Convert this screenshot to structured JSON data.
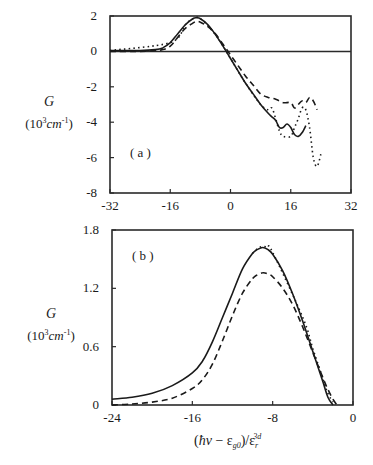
{
  "figure": {
    "x_axis_label": "(ħν − ε_g0)/ε_r^3d",
    "x_axis_label_parts": {
      "open": "(",
      "hnu": "ħν",
      "minus": " − ε",
      "sub": "g0",
      "close": ")/ε",
      "sub2": "r",
      "sup2": "3d"
    },
    "y_axis_label": {
      "symbol": "G",
      "unit_prefix": "(10",
      "unit_exp": "3",
      "unit_body": "cm",
      "unit_body_exp": "-1",
      "unit_close": ")"
    }
  },
  "chart_data": [
    {
      "type": "line",
      "panel_label": "( a )",
      "title": "",
      "xlabel": "",
      "ylabel": "G (10^3 cm^-1)",
      "xlim": [
        -32,
        32
      ],
      "ylim": [
        -8,
        2
      ],
      "x_ticks": [
        -32,
        -16,
        0,
        16,
        32
      ],
      "y_ticks": [
        2,
        0,
        -2,
        -4,
        -6,
        -8
      ],
      "x_tick_labels": [
        "-32",
        "-16",
        "0",
        "16",
        "32"
      ],
      "y_tick_labels": [
        "2",
        "0",
        "-2",
        "-4",
        "-6",
        "-8"
      ],
      "reference_line": {
        "y": 0,
        "style": "solid"
      },
      "grid": false,
      "legend": null,
      "series": [
        {
          "name": "solid",
          "style": "solid",
          "x": [
            -32,
            -24,
            -20,
            -18,
            -16,
            -14,
            -12,
            -10,
            -9,
            -8,
            -6,
            -4,
            -2,
            0,
            2,
            4,
            6,
            8,
            10,
            11,
            12,
            13,
            14,
            15,
            16,
            17,
            18,
            19,
            20
          ],
          "y": [
            0.05,
            0.05,
            0.1,
            0.2,
            0.5,
            1.0,
            1.5,
            1.85,
            1.9,
            1.85,
            1.5,
            0.95,
            0.3,
            -0.4,
            -1.1,
            -1.8,
            -2.4,
            -3.0,
            -3.5,
            -3.7,
            -3.9,
            -4.3,
            -4.3,
            -4.1,
            -4.3,
            -4.7,
            -4.8,
            -4.6,
            -4.2
          ]
        },
        {
          "name": "dashed",
          "style": "dashed",
          "x": [
            -32,
            -24,
            -20,
            -18,
            -16,
            -14,
            -12,
            -10,
            -9,
            -8,
            -6,
            -4,
            -2,
            0,
            2,
            4,
            6,
            8,
            10,
            12,
            14,
            16,
            17,
            18,
            19,
            20,
            21,
            22,
            23
          ],
          "y": [
            0.0,
            0.0,
            0.05,
            0.1,
            0.3,
            0.8,
            1.3,
            1.6,
            1.7,
            1.65,
            1.4,
            1.0,
            0.4,
            -0.2,
            -0.8,
            -1.4,
            -1.9,
            -2.4,
            -2.6,
            -2.7,
            -2.9,
            -2.9,
            -3.2,
            -3.0,
            -2.8,
            -2.9,
            -2.6,
            -2.8,
            -3.3
          ]
        },
        {
          "name": "dotted",
          "style": "dotted",
          "x": [
            -32,
            -16,
            -12,
            -10,
            -8,
            -4,
            0,
            4,
            8,
            10,
            11,
            12,
            13,
            14,
            16,
            17,
            18,
            19,
            20,
            21,
            22,
            23,
            24
          ],
          "y": [
            0.05,
            0.5,
            1.5,
            1.85,
            1.85,
            0.95,
            -0.4,
            -1.8,
            -3.0,
            -3.3,
            -3.2,
            -3.8,
            -4.5,
            -4.8,
            -4.8,
            -4.3,
            -3.8,
            -3.2,
            -3.3,
            -4.3,
            -6.0,
            -6.5,
            -5.8
          ]
        }
      ]
    },
    {
      "type": "line",
      "panel_label": "( b )",
      "title": "",
      "xlabel": "(ħν − ε_g0)/ε_r^3d",
      "ylabel": "G (10^3 cm^-1)",
      "xlim": [
        -24,
        0
      ],
      "ylim": [
        0,
        1.8
      ],
      "x_ticks": [
        -24,
        -16,
        -8,
        0
      ],
      "y_ticks": [
        1.8,
        1.2,
        0.6,
        0
      ],
      "x_tick_labels": [
        "-24",
        "-16",
        "-8",
        "0"
      ],
      "y_tick_labels": [
        "1.8",
        "1.2",
        "0.6",
        "0"
      ],
      "grid": false,
      "legend": null,
      "series": [
        {
          "name": "solid",
          "style": "solid",
          "x": [
            -24,
            -22,
            -20,
            -18,
            -16,
            -15,
            -14,
            -13,
            -12,
            -11,
            -10,
            -9.5,
            -9,
            -8.5,
            -8,
            -7,
            -6,
            -5,
            -4,
            -3,
            -2.5,
            -2
          ],
          "y": [
            0.06,
            0.08,
            0.12,
            0.2,
            0.33,
            0.45,
            0.65,
            0.9,
            1.15,
            1.4,
            1.56,
            1.6,
            1.62,
            1.6,
            1.55,
            1.38,
            1.14,
            0.86,
            0.55,
            0.24,
            0.08,
            0.0
          ]
        },
        {
          "name": "dashed",
          "style": "dashed",
          "x": [
            -24,
            -22,
            -20,
            -18,
            -16,
            -15,
            -14,
            -13,
            -12,
            -11,
            -10,
            -9.5,
            -9,
            -8.5,
            -8,
            -7,
            -6,
            -5,
            -4,
            -3,
            -2.5,
            -2,
            -1.6
          ],
          "y": [
            0.0,
            0.01,
            0.03,
            0.07,
            0.17,
            0.26,
            0.42,
            0.66,
            0.92,
            1.15,
            1.3,
            1.34,
            1.36,
            1.35,
            1.32,
            1.2,
            1.03,
            0.8,
            0.54,
            0.28,
            0.16,
            0.06,
            0.0
          ]
        },
        {
          "name": "dotted",
          "style": "dotted",
          "x": [
            -10,
            -9.5,
            -9,
            -8.5,
            -8,
            -5,
            -4,
            -3,
            -2.5,
            -2
          ],
          "y": [
            1.56,
            1.61,
            1.63,
            1.62,
            1.57,
            0.9,
            0.58,
            0.27,
            0.12,
            0.03
          ]
        }
      ]
    }
  ]
}
